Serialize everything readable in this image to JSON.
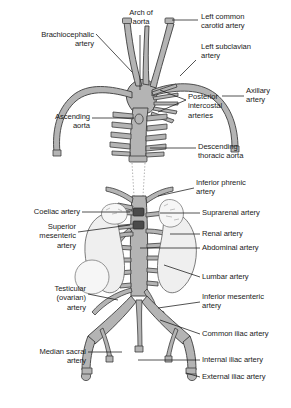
{
  "figure": {
    "type": "anatomical-diagram",
    "colors": {
      "vessel_fill": "#b4b4b4",
      "vessel_stroke": "#3c3c3c",
      "organ_fill": "#eeeeee",
      "organ_stroke": "#555555",
      "leader_line": "#1a1a1a",
      "text": "#1a1a1a",
      "background": "#ffffff"
    }
  },
  "labels": {
    "arch_of_aorta": "Arch of\naorta",
    "left_common_carotid_artery": "Left common\ncarotid artery",
    "brachiocephalic_artery": "Brachiocephalic\nartery",
    "left_subclavian_artery": "Left subclavian\nartery",
    "axillary_artery": "Axillary\nartery",
    "posterior_intercostal_arteries": "Posterior\nintercostal\narteries",
    "ascending_aorta": "Ascending\naorta",
    "descending_thoracic_aorta": "Descending\nthoracic aorta",
    "inferior_phrenic_artery": "Inferior phrenic\nartery",
    "coeliac_artery": "Coeliac artery",
    "suprarenal_artery": "Suprarenal artery",
    "superior_mesenteric_artery": "Superior\nmesenteric\nartery",
    "renal_artery": "Renal artery",
    "abdominal_artery": "Abdominal artery",
    "lumbar_artery": "Lumbar artery",
    "testicular_ovarian_artery": "Testicular\n(ovarian)\nartery",
    "inferior_mesenteric_artery": "Inferior mesenteric\nartery",
    "common_iliac_artery": "Common iliac artery",
    "median_sacral_artery": "Median sacral\nartery",
    "internal_iliac_artery": "Internal iliac artery",
    "external_iliac_artery": "External iliac artery"
  }
}
